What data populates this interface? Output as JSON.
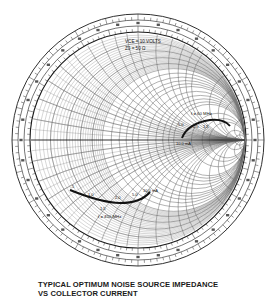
{
  "caption": {
    "line1": "TYPICAL OPTIMUM NOISE SOURCE IMPEDANCE",
    "line2": "VS COLLECTOR CURRENT"
  },
  "conditions": {
    "vce": "VCE = 10 VOLTS",
    "z0": "Z0 = 50 Ω"
  },
  "colors": {
    "ink": "#1a1a1a",
    "grid": "#555555",
    "background": "#ffffff"
  },
  "chart_data": {
    "type": "scatter",
    "subtype": "smith_chart",
    "title": "TYPICAL OPTIMUM NOISE SOURCE IMPEDANCE VS COLLECTOR CURRENT",
    "annotations": [
      "VCE = 10 VOLTS",
      "Z0 = 50 Ω"
    ],
    "grid": true,
    "legend": null,
    "series": [
      {
        "name": "f = 60 MHz",
        "label": "f = 60 MHz",
        "points": [
          {
            "ic_mA": 10.0,
            "label": "10.0 mA"
          },
          {
            "ic_mA": 5.0,
            "label": "5.0"
          },
          {
            "ic_mA": 2.0,
            "label": "2.0"
          },
          {
            "ic_mA": 1.5,
            "label": "1.5"
          },
          {
            "ic_mA": 1.0,
            "label": "1"
          },
          {
            "ic_mA": 0.5,
            "label": ".5"
          }
        ]
      },
      {
        "name": "f = 450 MHz",
        "label": "f = 450 MHz",
        "points": [
          {
            "ic_mA": 0.5,
            "label": ".5"
          },
          {
            "ic_mA": 1.0,
            "label": "1.0"
          },
          {
            "ic_mA": 1.5,
            "label": "1.5"
          },
          {
            "ic_mA": 2.0,
            "label": "2.0"
          },
          {
            "ic_mA": 5.0,
            "label": "5.0"
          },
          {
            "ic_mA": 10.0,
            "label": "10.0 mA"
          }
        ]
      }
    ]
  },
  "labels": {
    "f60": "f = 60 MHz",
    "f60_ic10": "10.0 mA",
    "f60_5": "5.0",
    "f60_2": "2.0",
    "f60_15": "1.5",
    "f450": "f = 450 MHz",
    "f450_05": ".5",
    "f450_1": "1.0",
    "f450_15": "1.5",
    "f450_2": "2.0",
    "f450_5": "5.0",
    "f450_ic10": "10.0 mA"
  }
}
